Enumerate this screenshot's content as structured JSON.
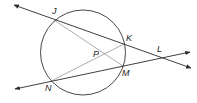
{
  "diagram": {
    "type": "circle-secants-chords",
    "colors": {
      "circle": "#333333",
      "secant": "#2a2a2a",
      "chord": "#8a8a8a",
      "label": "#222222"
    },
    "circle": {
      "cx": 83,
      "cy": 52.5,
      "r": 42.5
    },
    "points": {
      "J": {
        "label": "J",
        "x": 54,
        "y": 20,
        "lx": 52,
        "ly": 14
      },
      "K": {
        "label": "K",
        "x": 124,
        "y": 44,
        "lx": 126,
        "ly": 41
      },
      "L": {
        "label": "L",
        "x": 160,
        "y": 57,
        "lx": 157,
        "ly": 52
      },
      "M": {
        "label": "M",
        "x": 123,
        "y": 66,
        "lx": 122,
        "ly": 76
      },
      "N": {
        "label": "N",
        "x": 51,
        "y": 81,
        "lx": 45,
        "ly": 91
      },
      "P": {
        "label": "P",
        "x": 104,
        "y": 54,
        "lx": 93,
        "ly": 57
      }
    },
    "secants": [
      {
        "name": "line-JL",
        "from": [
          14,
          5
        ],
        "to": [
          191,
          68
        ]
      },
      {
        "name": "line-NL",
        "from": [
          15,
          89
        ],
        "to": [
          190,
          52
        ]
      }
    ],
    "chords": [
      {
        "name": "chord-JM",
        "from": "J",
        "to": "M"
      },
      {
        "name": "chord-NK",
        "from": "N",
        "to": "K"
      }
    ]
  }
}
